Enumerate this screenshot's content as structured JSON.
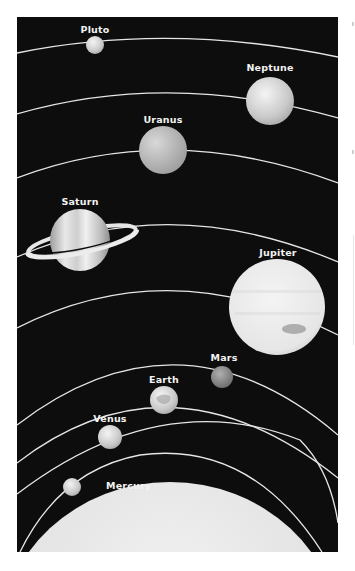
{
  "diagram": {
    "background_color": "#0d0d0d",
    "orbit_color": "#e6e6e6",
    "sun": {
      "name": "Sun",
      "color": "#e8e8e8"
    },
    "planets": [
      {
        "name": "Pluto",
        "label": "Pluto",
        "cx": 95,
        "cy": 45,
        "r": 9,
        "color": "#bdbdbd"
      },
      {
        "name": "Neptune",
        "label": "Neptune",
        "cx": 270,
        "cy": 101,
        "r": 24,
        "color": "#cfcfcf"
      },
      {
        "name": "Uranus",
        "label": "Uranus",
        "cx": 163,
        "cy": 150,
        "r": 24,
        "color": "#bcbcbc"
      },
      {
        "name": "Saturn",
        "label": "Saturn",
        "cx": 80,
        "cy": 240,
        "r": 30,
        "color": "#d9d9d9"
      },
      {
        "name": "Jupiter",
        "label": "Jupiter",
        "cx": 277,
        "cy": 307,
        "r": 48,
        "color": "#ededed"
      },
      {
        "name": "Mars",
        "label": "Mars",
        "cx": 222,
        "cy": 377,
        "r": 11,
        "color": "#8c8c8c"
      },
      {
        "name": "Earth",
        "label": "Earth",
        "cx": 164,
        "cy": 400,
        "r": 14,
        "color": "#e0e0e0"
      },
      {
        "name": "Venus",
        "label": "Venus",
        "cx": 110,
        "cy": 437,
        "r": 12,
        "color": "#d6d6d6"
      },
      {
        "name": "Mercury",
        "label": "Mercury",
        "cx": 72,
        "cy": 487,
        "r": 9,
        "color": "#cfcfcf"
      }
    ]
  }
}
